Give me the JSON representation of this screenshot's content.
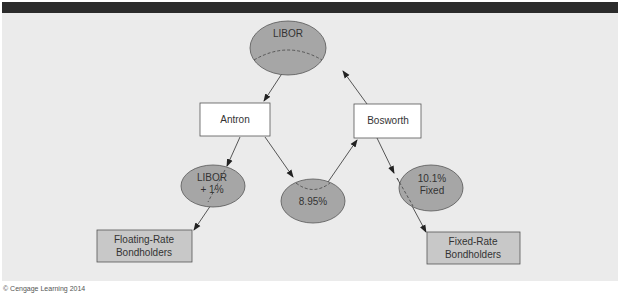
{
  "diagram": {
    "type": "interest-rate-swap-flow",
    "nodes": {
      "libor": {
        "label": "LIBOR",
        "shape": "ellipse"
      },
      "antron": {
        "label": "Antron",
        "shape": "box"
      },
      "bosworth": {
        "label": "Bosworth",
        "shape": "box"
      },
      "libor_plus": {
        "line1": "LIBOR",
        "line2": "+ 1%",
        "shape": "ellipse"
      },
      "fixed_swap": {
        "label": "8.95%",
        "shape": "ellipse"
      },
      "fixed_bond": {
        "line1": "10.1%",
        "line2": "Fixed",
        "shape": "ellipse"
      },
      "floating_holders": {
        "line1": "Floating-Rate",
        "line2": "Bondholders",
        "shape": "box"
      },
      "fixed_holders": {
        "line1": "Fixed-Rate",
        "line2": "Bondholders",
        "shape": "box"
      }
    },
    "edges": [
      {
        "from": "libor",
        "to": "antron"
      },
      {
        "from": "bosworth",
        "to": "libor"
      },
      {
        "from": "antron",
        "to": "libor_plus"
      },
      {
        "from": "antron",
        "to": "fixed_swap"
      },
      {
        "from": "fixed_swap",
        "to": "bosworth"
      },
      {
        "from": "bosworth",
        "to": "fixed_bond"
      },
      {
        "from": "libor_plus",
        "to": "floating_holders"
      },
      {
        "from": "fixed_bond",
        "to": "fixed_holders"
      }
    ]
  },
  "colors": {
    "ellipse_fill": "#a6a6a6",
    "box_fill_white": "#ffffff",
    "box_fill_gray": "#c8c8c8",
    "panel_bg": "#ebebeb",
    "top_bar": "#2b2b2b"
  },
  "footer": {
    "credit": "© Cengage Learning 2014"
  }
}
